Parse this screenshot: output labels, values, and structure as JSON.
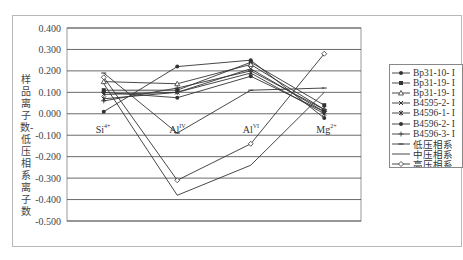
{
  "chart_data": {
    "type": "line",
    "title": "",
    "xlabel": "",
    "ylabel": "样品离子数-低压相系离子数",
    "categories": [
      "Si4+",
      "AlIV",
      "AlVI",
      "Mg2+"
    ],
    "category_labels": [
      {
        "base": "Si",
        "sup": "4+"
      },
      {
        "base": "Al",
        "sup": "IV"
      },
      {
        "base": "Al",
        "sup": "VI"
      },
      {
        "base": "Mg",
        "sup": "2+"
      }
    ],
    "ylim": [
      -0.5,
      0.4
    ],
    "yticks": [
      "0.400",
      "0.300",
      "0.200",
      "0.100",
      "0.000",
      "-0.100",
      "-0.200",
      "-0.300",
      "-0.400",
      "-0.500"
    ],
    "grid": true,
    "legend_position": "right",
    "series": [
      {
        "name": "Bp31-10- I",
        "marker": "dot",
        "values": [
          0.01,
          0.22,
          0.25,
          -0.02
        ]
      },
      {
        "name": "Bp31-19- I",
        "marker": "square",
        "values": [
          0.11,
          0.11,
          0.24,
          0.04
        ]
      },
      {
        "name": "Bp31-19- I",
        "marker": "triangle",
        "values": [
          0.15,
          0.14,
          0.23,
          0.02
        ]
      },
      {
        "name": "B4595-2- I",
        "marker": "x",
        "values": [
          0.09,
          0.1,
          0.21,
          0.01
        ]
      },
      {
        "name": "B4596-1- I",
        "marker": "star",
        "values": [
          0.07,
          0.1,
          0.19,
          0.0
        ]
      },
      {
        "name": "B4596-2- I",
        "marker": "dot",
        "values": [
          0.1,
          0.075,
          0.175,
          0.01
        ]
      },
      {
        "name": "B4596-3- I",
        "marker": "plus",
        "values": [
          0.06,
          0.12,
          0.2,
          0.02
        ]
      },
      {
        "name": "低压相系",
        "marker": "dash",
        "values": [
          0.19,
          -0.09,
          0.11,
          0.12
        ]
      },
      {
        "name": "中压相系",
        "marker": "none",
        "values": [
          0.14,
          -0.38,
          -0.24,
          0.1
        ]
      },
      {
        "name": "高压相系",
        "marker": "diamond",
        "values": [
          0.17,
          -0.31,
          -0.14,
          0.28
        ]
      }
    ]
  },
  "legend": {
    "items": [
      "Bp31-10- I",
      "Bp31-19- I",
      "Bp31-19- I",
      "B4595-2- I",
      "B4596-1- I",
      "B4596-2- I",
      "B4596-3- I",
      "低压相系",
      "中压相系",
      "高压相系"
    ]
  },
  "colors": {
    "line": "#333333",
    "grid": "#444444",
    "frame": "#b8b8b8"
  }
}
